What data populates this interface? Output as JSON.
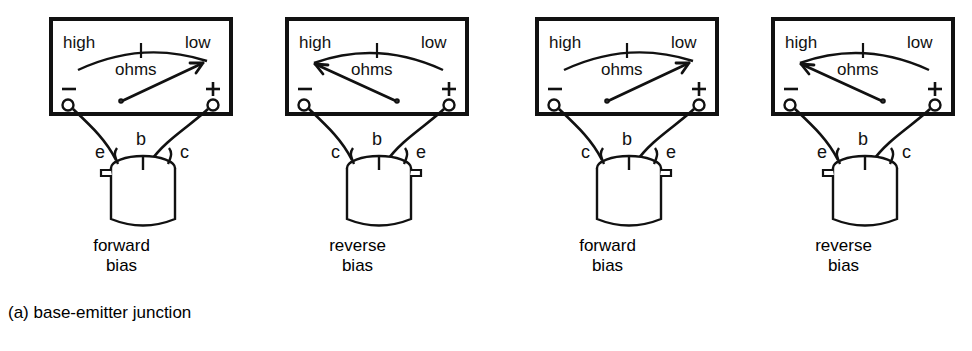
{
  "figure": {
    "panels": [
      {
        "id": "a",
        "caption": "(a) base-emitter junction",
        "units": [
          {
            "meter": {
              "scale_left_label": "high",
              "scale_right_label": "low",
              "scale_name": "ohms",
              "negative_terminal": "−",
              "positive_terminal": "+",
              "needle_direction": "right",
              "reading": "low"
            },
            "transistor": {
              "lead_left": "e",
              "lead_center": "b",
              "lead_right": "c",
              "tab_side": "left"
            },
            "bias_line1": "forward",
            "bias_line2": "bias"
          },
          {
            "meter": {
              "scale_left_label": "high",
              "scale_right_label": "low",
              "scale_name": "ohms",
              "negative_terminal": "−",
              "positive_terminal": "+",
              "needle_direction": "left",
              "reading": "high"
            },
            "transistor": {
              "lead_left": "c",
              "lead_center": "b",
              "lead_right": "e",
              "tab_side": "right"
            },
            "bias_line1": "reverse",
            "bias_line2": "bias"
          }
        ]
      },
      {
        "id": "b",
        "caption": "(b) collector-base junction",
        "units": [
          {
            "meter": {
              "scale_left_label": "high",
              "scale_right_label": "low",
              "scale_name": "ohms",
              "negative_terminal": "−",
              "positive_terminal": "+",
              "needle_direction": "right",
              "reading": "low"
            },
            "transistor": {
              "lead_left": "c",
              "lead_center": "b",
              "lead_right": "e",
              "tab_side": "right"
            },
            "bias_line1": "forward",
            "bias_line2": "bias"
          },
          {
            "meter": {
              "scale_left_label": "high",
              "scale_right_label": "low",
              "scale_name": "ohms",
              "negative_terminal": "−",
              "positive_terminal": "+",
              "needle_direction": "left",
              "reading": "high"
            },
            "transistor": {
              "lead_left": "e",
              "lead_center": "b",
              "lead_right": "c",
              "tab_side": "left"
            },
            "bias_line1": "reverse",
            "bias_line2": "bias"
          }
        ]
      }
    ]
  },
  "colors": {
    "ink": "#111111",
    "background": "#ffffff"
  }
}
